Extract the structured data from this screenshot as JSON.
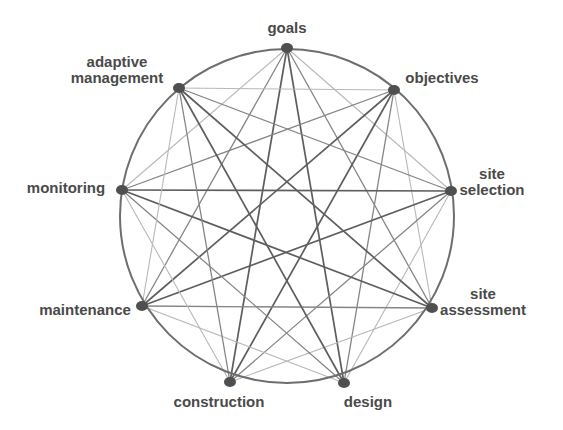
{
  "diagram": {
    "type": "complete-graph-circle",
    "circle": {
      "cx": 287,
      "cy": 216,
      "r": 167,
      "stroke": "#6e6e6e",
      "stroke_width": 2
    },
    "node_color": "#4f4f4f",
    "nodes": [
      {
        "id": "goals",
        "lines": [
          "goals"
        ],
        "x": 287,
        "y": 48,
        "lx": 287,
        "ly": 20,
        "align": "center"
      },
      {
        "id": "objectives",
        "lines": [
          "objectives"
        ],
        "x": 394,
        "y": 90,
        "lx": 442,
        "ly": 70,
        "align": "center"
      },
      {
        "id": "site-selection",
        "lines": [
          "site",
          "selection"
        ],
        "x": 451,
        "y": 191,
        "lx": 492,
        "ly": 166,
        "align": "center"
      },
      {
        "id": "site-assessment",
        "lines": [
          "site",
          "assessment"
        ],
        "x": 432,
        "y": 308,
        "lx": 483,
        "ly": 286,
        "align": "center"
      },
      {
        "id": "design",
        "lines": [
          "design"
        ],
        "x": 344,
        "y": 383,
        "lx": 368,
        "ly": 394,
        "align": "center"
      },
      {
        "id": "construction",
        "lines": [
          "construction"
        ],
        "x": 230,
        "y": 382,
        "lx": 219,
        "ly": 394,
        "align": "center"
      },
      {
        "id": "maintenance",
        "lines": [
          "maintenance"
        ],
        "x": 142,
        "y": 306,
        "lx": 85,
        "ly": 302,
        "align": "center"
      },
      {
        "id": "monitoring",
        "lines": [
          "monitoring"
        ],
        "x": 122,
        "y": 190,
        "lx": 66,
        "ly": 180,
        "align": "center"
      },
      {
        "id": "adaptive-management",
        "lines": [
          "adaptive",
          "management"
        ],
        "x": 179,
        "y": 88,
        "lx": 117,
        "ly": 54,
        "align": "center"
      }
    ],
    "edge_styles": {
      "dark": {
        "stroke": "#5e5e5e",
        "width": 1.7
      },
      "mid": {
        "stroke": "#858585",
        "width": 1.3
      },
      "light": {
        "stroke": "#b8b8b8",
        "width": 1.1
      }
    }
  }
}
